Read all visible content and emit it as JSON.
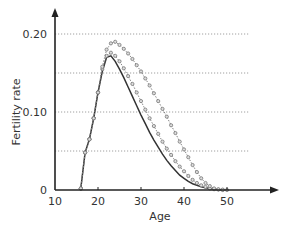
{
  "chart_data": {
    "type": "line",
    "title": "",
    "xlabel": "Age",
    "ylabel": "Fertility rate",
    "xlim": [
      10,
      60
    ],
    "ylim": [
      0,
      0.22
    ],
    "x_ticks": [
      10,
      20,
      30,
      40,
      50
    ],
    "x_tick_labels": [
      "10",
      "20",
      "30",
      "40",
      "50"
    ],
    "y_ticks": [
      0,
      0.1,
      0.2
    ],
    "y_tick_labels": [
      "0",
      "0.10",
      "0.20"
    ],
    "grid": {
      "horizontal_dotted_at": [
        0.05,
        0.1,
        0.15,
        0.2
      ]
    },
    "legend": null,
    "series": [
      {
        "name": "solid",
        "style": "solid",
        "x": [
          16,
          17,
          18,
          19,
          20,
          21,
          22,
          23,
          24,
          25,
          26,
          27,
          28,
          29,
          30,
          31,
          32,
          33,
          34,
          35,
          36,
          37,
          38,
          39,
          40,
          41,
          42,
          43,
          44,
          45,
          46,
          47,
          48,
          49
        ],
        "values": [
          0.002,
          0.048,
          0.065,
          0.092,
          0.125,
          0.152,
          0.17,
          0.172,
          0.165,
          0.155,
          0.144,
          0.132,
          0.12,
          0.108,
          0.096,
          0.085,
          0.074,
          0.064,
          0.055,
          0.046,
          0.038,
          0.031,
          0.025,
          0.019,
          0.015,
          0.011,
          0.008,
          0.006,
          0.004,
          0.003,
          0.002,
          0.001,
          0.0005,
          0.0
        ]
      },
      {
        "name": "dotted-1",
        "style": "dotted-markers",
        "x": [
          16,
          17,
          18,
          19,
          20,
          21,
          22,
          23,
          24,
          25,
          26,
          27,
          28,
          29,
          30,
          31,
          32,
          33,
          34,
          35,
          36,
          37,
          38,
          39,
          40,
          41,
          42,
          43,
          44,
          45,
          46,
          47,
          48,
          49
        ],
        "values": [
          0.002,
          0.048,
          0.065,
          0.092,
          0.125,
          0.155,
          0.172,
          0.176,
          0.172,
          0.165,
          0.156,
          0.146,
          0.136,
          0.125,
          0.114,
          0.103,
          0.092,
          0.082,
          0.072,
          0.062,
          0.053,
          0.045,
          0.037,
          0.03,
          0.024,
          0.018,
          0.013,
          0.009,
          0.006,
          0.004,
          0.002,
          0.001,
          0.0005,
          0.0
        ]
      },
      {
        "name": "dotted-2",
        "style": "dotted-markers",
        "x": [
          16,
          17,
          18,
          19,
          20,
          21,
          22,
          23,
          24,
          25,
          26,
          27,
          28,
          29,
          30,
          31,
          32,
          33,
          34,
          35,
          36,
          37,
          38,
          39,
          40,
          41,
          42,
          43,
          44,
          45,
          46,
          47,
          48,
          49,
          50
        ],
        "values": [
          0.002,
          0.048,
          0.065,
          0.092,
          0.125,
          0.158,
          0.18,
          0.188,
          0.19,
          0.186,
          0.181,
          0.175,
          0.168,
          0.16,
          0.152,
          0.143,
          0.134,
          0.124,
          0.114,
          0.104,
          0.094,
          0.083,
          0.073,
          0.062,
          0.052,
          0.042,
          0.032,
          0.023,
          0.015,
          0.009,
          0.005,
          0.002,
          0.001,
          0.0005,
          0.0
        ]
      }
    ]
  },
  "colors": {
    "axis": "#222222",
    "line": "#333333",
    "marker": "#777777",
    "grid": "#888888"
  }
}
